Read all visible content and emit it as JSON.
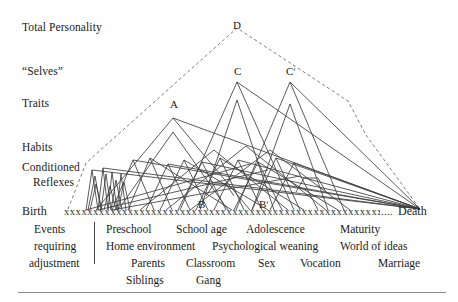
{
  "figure": {
    "title_visible": false,
    "background_color": "#ffffff",
    "line_color": "#3a3a3a",
    "dashed_color": "#6b6b6b",
    "stage_labels": [
      {
        "text": "Total Personality",
        "x": 22,
        "y": 22
      },
      {
        "text": "“Selves”",
        "x": 22,
        "y": 66
      },
      {
        "text": "Traits",
        "x": 22,
        "y": 98
      },
      {
        "text": "Habits",
        "x": 22,
        "y": 142
      },
      {
        "text": "Conditioned",
        "x": 22,
        "y": 162
      },
      {
        "text": "Reflexes",
        "x": 33,
        "y": 177
      }
    ],
    "peak_labels": [
      {
        "text": "D",
        "x": 233,
        "y": 20
      },
      {
        "text": "C",
        "x": 234,
        "y": 66
      },
      {
        "text": "Cʹ",
        "x": 286,
        "y": 66
      },
      {
        "text": "A",
        "x": 170,
        "y": 99
      },
      {
        "text": "B",
        "x": 198,
        "y": 199
      },
      {
        "text": "Bʹ",
        "x": 259,
        "y": 199
      }
    ],
    "axis": {
      "start_label": "Birth",
      "end_label": "Death",
      "tick_marks": "xxxxxxxxxxxxxxxxxxxxxxxxxxxxxxxxxxxxxxxxxxxxxxxxxxxxxxxxxxxxxxxxxxx",
      "trailing_dots": ".....",
      "baseline_y": 210
    },
    "caption": {
      "left_column": [
        "Events",
        "requiring",
        "adjustment"
      ],
      "rows": [
        [
          "Preschool",
          "School age",
          "Adolescence",
          "Maturity"
        ],
        [
          "Home environment",
          "Psychological weaning",
          "World of ideas"
        ],
        [
          "Parents",
          "Classroom",
          "Sex",
          "Vocation",
          "Marriage"
        ],
        [
          "Siblings",
          "Gang"
        ]
      ]
    }
  }
}
